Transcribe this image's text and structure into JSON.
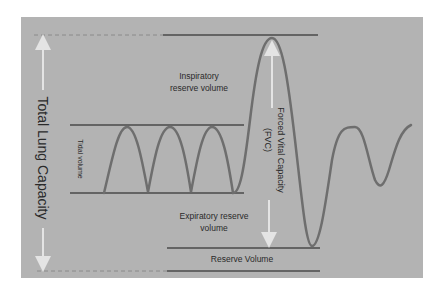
{
  "diagram": {
    "colors": {
      "background": "#ffffff",
      "panel": "#b3b3b3",
      "lines": "#4a4a4a",
      "curve": "#6e6e6e",
      "arrows": "#e4e4e4",
      "text": "#2a2a2a"
    },
    "labels": {
      "total_lung_capacity": "Total Lung Capacity",
      "inspiratory_line1": "Inspiratory",
      "inspiratory_line2": "reserve volume",
      "tidal_volume": "Tidal volume",
      "fvc_line1": "Forced Vital Capacity",
      "fvc_line2": "(FVC)",
      "expiratory_line1": "Expiratory reserve",
      "expiratory_line2": "volume",
      "reserve_volume": "Reserve Volume"
    }
  }
}
